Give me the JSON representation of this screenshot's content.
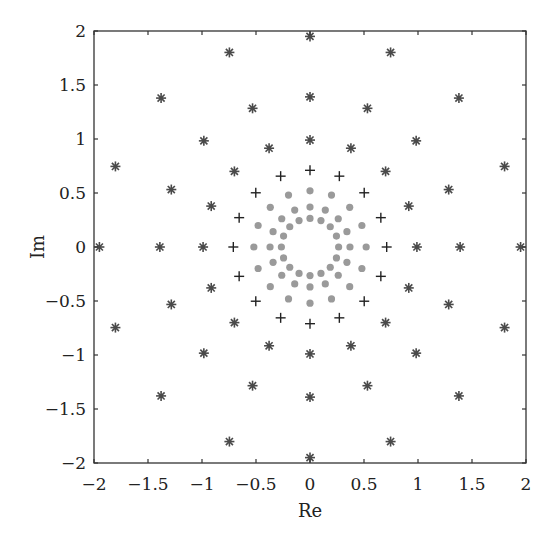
{
  "chart_data": {
    "type": "scatter",
    "title": "",
    "xlabel": "Re",
    "ylabel": "Im",
    "xlim": [
      -2,
      2
    ],
    "ylim": [
      -2,
      2
    ],
    "xticks": [
      -2,
      -1.5,
      -1,
      -0.5,
      0,
      0.5,
      1,
      1.5,
      2
    ],
    "yticks": [
      -2,
      -1.5,
      -1,
      -0.5,
      0,
      0.5,
      1,
      1.5,
      2
    ],
    "xtick_labels": [
      "−2",
      "−1.5",
      "−1",
      "−0.5",
      "0",
      "0.5",
      "1",
      "1.5",
      "2"
    ],
    "ytick_labels": [
      "−2",
      "−1.5",
      "−1",
      "−0.5",
      "0",
      "0.5",
      "1",
      "1.5",
      "2"
    ],
    "grid": false,
    "legend": null,
    "points_per_ring": 16,
    "angle_step_deg": 22.5,
    "series": [
      {
        "name": "asterisk",
        "marker": "*",
        "color": "#4a4a4a",
        "ring_radii": [
          1.95,
          1.39,
          0.99
        ],
        "description": "16 points per ring at angles k*22.5 deg"
      },
      {
        "name": "plus",
        "marker": "+",
        "color": "#222222",
        "ring_radii": [
          0.71
        ],
        "description": "16 points at angles k*22.5 deg"
      },
      {
        "name": "dot",
        "marker": "o",
        "color": "#9a9a9a",
        "ring_radii": [
          0.52,
          0.37,
          0.265
        ],
        "description": "16 points per ring at angles k*22.5 deg"
      }
    ]
  }
}
